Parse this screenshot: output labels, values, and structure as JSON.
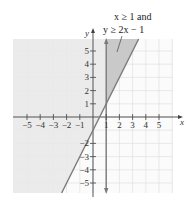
{
  "chart_data": {
    "type": "inequality-graph",
    "title": "",
    "annotation": [
      "x ≥ 1 and",
      "y ≥ 2x − 1"
    ],
    "xlabel": "x",
    "ylabel": "y",
    "xlim": [
      -6,
      6
    ],
    "ylim": [
      -5.75,
      5.9
    ],
    "x_ticks": [
      -5,
      -4,
      -3,
      -2,
      -1,
      1,
      2,
      3,
      4,
      5
    ],
    "y_ticks": [
      -5,
      -4,
      -3,
      -2,
      1,
      2,
      3,
      4,
      5
    ],
    "x_tick_labels": [
      "−5",
      "−4",
      "−3",
      "−2",
      "−1",
      "1",
      "2",
      "3",
      "4",
      "5"
    ],
    "y_tick_labels": [
      "−5",
      "−4",
      "−3",
      "−2",
      "1",
      "2",
      "3",
      "4",
      "5"
    ],
    "grid": true,
    "boundary_lines": [
      {
        "equation": "x = 1",
        "style": "solid",
        "arrows": "both"
      },
      {
        "equation": "y = 2x - 1",
        "style": "solid"
      }
    ],
    "shaded_regions": [
      {
        "inequality": "y ≥ 2x − 1",
        "shade": "light"
      },
      {
        "inequality": "x ≥ 1 and y ≥ 2x − 1",
        "shade": "dark"
      }
    ],
    "colors": {
      "light_shade": "#e9e9e9",
      "dark_shade": "#c9c9c9",
      "line": "#7a7a7a",
      "grid": "#dcdcdc",
      "axis": "#444444"
    }
  },
  "labels": {
    "annotation_line1": "x ≥ 1 and",
    "annotation_line2": "y ≥ 2x − 1",
    "x_axis": "x",
    "y_axis": "y"
  }
}
